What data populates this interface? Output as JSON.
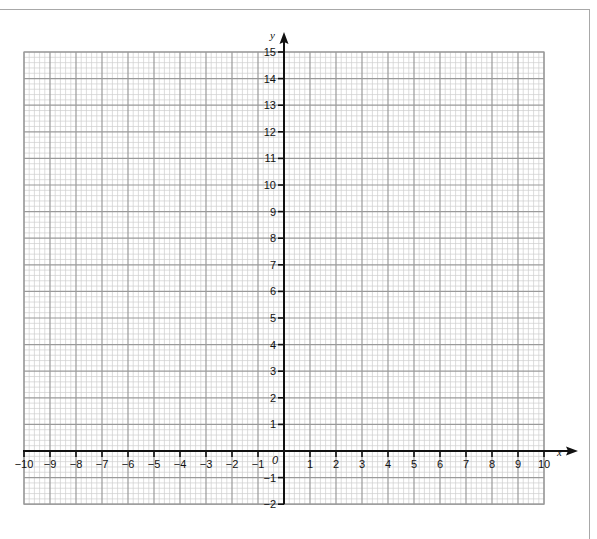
{
  "chart_data": {
    "type": "scatter",
    "title": "",
    "xlabel": "x",
    "ylabel": "y",
    "xlim": [
      -10,
      10
    ],
    "ylim": [
      -2,
      15
    ],
    "x_ticks": [
      -10,
      -9,
      -8,
      -7,
      -6,
      -5,
      -4,
      -3,
      -2,
      -1,
      1,
      2,
      3,
      4,
      5,
      6,
      7,
      8,
      9,
      10
    ],
    "x_tick_labels": [
      "−10",
      "−9",
      "−8",
      "−7",
      "−6",
      "−5",
      "−4",
      "−3",
      "−2",
      "−1",
      "1",
      "2",
      "3",
      "4",
      "5",
      "6",
      "7",
      "8",
      "9",
      "10"
    ],
    "y_ticks": [
      -2,
      -1,
      1,
      2,
      3,
      4,
      5,
      6,
      7,
      8,
      9,
      10,
      11,
      12,
      13,
      14,
      15
    ],
    "y_tick_labels": [
      "−2",
      "−1",
      "1",
      "2",
      "3",
      "4",
      "5",
      "6",
      "7",
      "8",
      "9",
      "10",
      "11",
      "12",
      "13",
      "14",
      "15"
    ],
    "origin_label": "0",
    "grid": true,
    "minor_divisions_per_unit": 5,
    "series": [],
    "colors": {
      "minor_grid": "#cfcfcf",
      "major_grid": "#9a9a9a",
      "axis": "#111111",
      "frame": "#a8a8a8"
    }
  }
}
